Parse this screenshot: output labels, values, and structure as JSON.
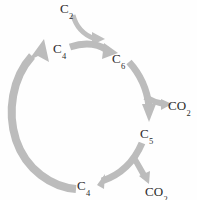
{
  "diagram": {
    "type": "cycle-diagram",
    "background_color": "#fefefe",
    "arrow_color": "#b9b9b9",
    "text_color": "#2b2b2b",
    "nodes": [
      {
        "id": "c2",
        "element": "C",
        "carbons": "2",
        "role": "input",
        "position": "top"
      },
      {
        "id": "c4_top",
        "element": "C",
        "carbons": "4",
        "role": "cycle",
        "position": "upper-left"
      },
      {
        "id": "c6",
        "element": "C",
        "carbons": "6",
        "role": "cycle",
        "position": "upper-right"
      },
      {
        "id": "co2_right",
        "element": "CO",
        "carbons": "2",
        "role": "output",
        "position": "right"
      },
      {
        "id": "c5",
        "element": "C",
        "carbons": "5",
        "role": "cycle",
        "position": "mid-right"
      },
      {
        "id": "c4_bottom",
        "element": "C",
        "carbons": "4",
        "role": "cycle",
        "position": "bottom"
      },
      {
        "id": "co2_bottom",
        "element": "CO",
        "carbons": "2",
        "role": "output",
        "position": "bottom-right"
      }
    ],
    "labels": {
      "c2": "C",
      "c2_sub": "2",
      "c4_top": "C",
      "c4_top_sub": "4",
      "c6": "C",
      "c6_sub": "6",
      "co2_right": "CO",
      "co2_right_sub": "2",
      "c5": "C",
      "c5_sub": "5",
      "c4_bottom": "C",
      "c4_bottom_sub": "4",
      "co2_bottom": "CO",
      "co2_bottom_sub": "2"
    },
    "arrows": [
      {
        "id": "arrow-c2-in",
        "from": "c2",
        "to": "c4-c6-junction",
        "style": "curved"
      },
      {
        "id": "arrow-c4-to-c6",
        "from": "c4_top",
        "to": "c6",
        "style": "curved-thick"
      },
      {
        "id": "arrow-c6-to-c5",
        "from": "c6",
        "to": "c5",
        "style": "curved-thick"
      },
      {
        "id": "arrow-co2-right",
        "from": "c6-c5-path",
        "to": "co2_right",
        "style": "branch"
      },
      {
        "id": "arrow-c5-to-c4",
        "from": "c5",
        "to": "c4_bottom",
        "style": "curved-thick"
      },
      {
        "id": "arrow-co2-bottom",
        "from": "c5-c4-path",
        "to": "co2_bottom",
        "style": "branch"
      },
      {
        "id": "arrow-c4-to-c4",
        "from": "c4_bottom",
        "to": "c4_top",
        "style": "major-arc"
      }
    ]
  }
}
